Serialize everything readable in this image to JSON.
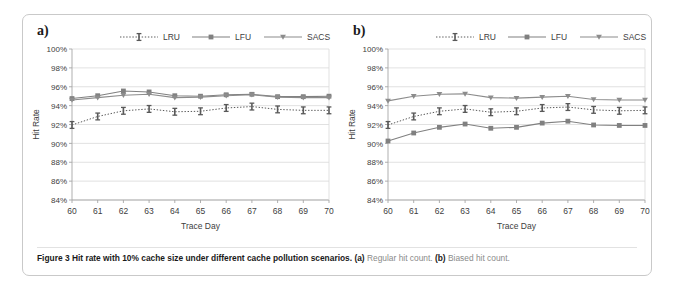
{
  "figure": {
    "caption_bold": "Figure 3 Hit rate with 10% cache size under different cache pollution scenarios.",
    "caption_a_tag": "(a)",
    "caption_a_text": " Regular hit count. ",
    "caption_b_tag": "(b)",
    "caption_b_text": " Biased hit count."
  },
  "panels": {
    "a": {
      "label": "a)"
    },
    "b": {
      "label": "b)"
    }
  },
  "axis": {
    "ylabel": "Hit Rate",
    "xlabel": "Trace Day",
    "yticks": [
      "100%",
      "98%",
      "96%",
      "94%",
      "92%",
      "90%",
      "88%",
      "86%",
      "84%"
    ],
    "xticks": [
      "60",
      "61",
      "62",
      "63",
      "64",
      "65",
      "66",
      "67",
      "68",
      "69",
      "70"
    ]
  },
  "legend": {
    "entries": [
      "LRU",
      "LFU",
      "SACS"
    ]
  },
  "colors": {
    "lru": "#595959",
    "lfu": "#808080",
    "sacs": "#8c8c8c",
    "grid": "#d9d9d9",
    "axis": "#a6a6a6",
    "text": "#404040"
  },
  "chart_data": [
    {
      "type": "line",
      "title": "a) Regular hit count",
      "xlabel": "Trace Day",
      "ylabel": "Hit Rate",
      "ylim": [
        84,
        100
      ],
      "yticks": [
        84,
        86,
        88,
        90,
        92,
        94,
        96,
        98,
        100
      ],
      "x": [
        60,
        61,
        62,
        63,
        64,
        65,
        66,
        67,
        68,
        69,
        70
      ],
      "grid": "horizontal",
      "legend_position": "top-center",
      "series": [
        {
          "name": "LRU",
          "style": "dotted",
          "marker": "errorbar",
          "values": [
            91.95,
            92.85,
            93.45,
            93.65,
            93.35,
            93.4,
            93.75,
            93.9,
            93.6,
            93.5,
            93.5
          ]
        },
        {
          "name": "LFU",
          "style": "solid",
          "marker": "square",
          "values": [
            94.75,
            95.05,
            95.55,
            95.45,
            95.05,
            95.0,
            95.15,
            95.2,
            94.95,
            94.95,
            95.0
          ]
        },
        {
          "name": "SACS",
          "style": "solid",
          "marker": "triangle-down",
          "values": [
            94.6,
            94.85,
            95.1,
            95.2,
            94.85,
            94.9,
            95.05,
            95.15,
            94.9,
            94.85,
            94.85
          ]
        }
      ]
    },
    {
      "type": "line",
      "title": "b) Biased hit count",
      "xlabel": "Trace Day",
      "ylabel": "Hit Rate",
      "ylim": [
        84,
        100
      ],
      "yticks": [
        84,
        86,
        88,
        90,
        92,
        94,
        96,
        98,
        100
      ],
      "x": [
        60,
        61,
        62,
        63,
        64,
        65,
        66,
        67,
        68,
        69,
        70
      ],
      "grid": "horizontal",
      "legend_position": "top-center",
      "series": [
        {
          "name": "LRU",
          "style": "dotted",
          "marker": "errorbar",
          "values": [
            91.95,
            92.85,
            93.4,
            93.65,
            93.3,
            93.4,
            93.75,
            93.85,
            93.55,
            93.45,
            93.5
          ]
        },
        {
          "name": "LFU",
          "style": "solid",
          "marker": "square",
          "values": [
            90.25,
            91.1,
            91.7,
            92.05,
            91.6,
            91.7,
            92.15,
            92.35,
            91.95,
            91.9,
            91.9
          ]
        },
        {
          "name": "SACS",
          "style": "solid",
          "marker": "triangle-down",
          "values": [
            94.5,
            95.0,
            95.2,
            95.25,
            94.85,
            94.8,
            94.9,
            95.0,
            94.65,
            94.6,
            94.6
          ]
        }
      ]
    }
  ]
}
